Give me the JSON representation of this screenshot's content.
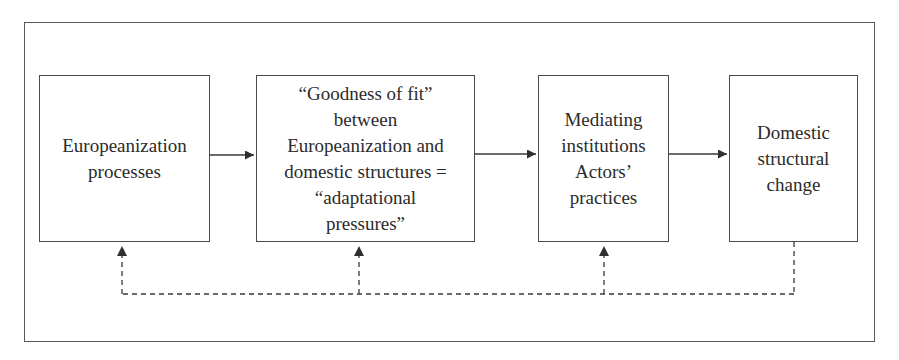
{
  "diagram": {
    "type": "flowchart",
    "nodes": [
      {
        "id": "n1",
        "label": "Europeanization\nprocesses"
      },
      {
        "id": "n2",
        "label": "“Goodness of fit”\nbetween\nEuropeanization and\ndomestic structures =\n“adaptational\npressures”"
      },
      {
        "id": "n3",
        "label": "Mediating\ninstitutions\nActors’\npractices"
      },
      {
        "id": "n4",
        "label": "Domestic\nstructural\nchange"
      }
    ],
    "edges": [
      {
        "from": "n1",
        "to": "n2",
        "style": "solid"
      },
      {
        "from": "n2",
        "to": "n3",
        "style": "solid"
      },
      {
        "from": "n3",
        "to": "n4",
        "style": "solid"
      },
      {
        "from": "n4",
        "to": "n1",
        "style": "dashed",
        "kind": "feedback"
      },
      {
        "from": "n4",
        "to": "n2",
        "style": "dashed",
        "kind": "feedback"
      },
      {
        "from": "n4",
        "to": "n3",
        "style": "dashed",
        "kind": "feedback"
      }
    ],
    "colors": {
      "line": "#3a3a3a",
      "text": "#2b2b2b",
      "background": "#ffffff"
    }
  }
}
